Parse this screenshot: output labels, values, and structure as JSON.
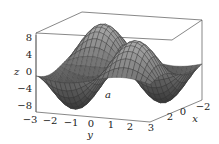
{
  "chart_data": {
    "type": "surface3d",
    "title": "",
    "annotation": "a",
    "xlabel": "x",
    "ylabel": "y",
    "zlabel": "z",
    "x_ticks": [
      "2",
      "0",
      "−2"
    ],
    "y_ticks": [
      "−3",
      "−2",
      "−1",
      "0",
      "1",
      "2",
      "3"
    ],
    "z_ticks": [
      "8",
      "4",
      "0",
      "−4",
      "−8"
    ],
    "xlim": [
      -3,
      3
    ],
    "ylim": [
      -3,
      3
    ],
    "zlim": [
      -8,
      8
    ]
  },
  "colors": {
    "mesh_dark": "#333333",
    "mesh_light": "#9a9a9a",
    "box": "#555555"
  }
}
